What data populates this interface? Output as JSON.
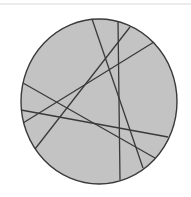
{
  "diagram": {
    "width": 191,
    "height": 197,
    "background": "#ffffff",
    "top_rule": {
      "x1": 0,
      "y1": 4,
      "x2": 191,
      "y2": 4,
      "color": "#d8d8d8"
    },
    "circle": {
      "cx": 99,
      "cy": 101.5,
      "rx": 78,
      "ry": 82.5,
      "fill": "#c3c3c3",
      "stroke": "#3a3a3a",
      "stroke_width": 1.4
    },
    "chords": [
      {
        "id": "chord-1",
        "x1": 92,
        "y1": 19,
        "x2": 143,
        "y2": 168
      },
      {
        "id": "chord-2",
        "x1": 118,
        "y1": 21,
        "x2": 120,
        "y2": 180
      },
      {
        "id": "chord-3",
        "x1": 130,
        "y1": 27,
        "x2": 35,
        "y2": 149
      },
      {
        "id": "chord-4",
        "x1": 154,
        "y1": 42,
        "x2": 23,
        "y2": 123
      },
      {
        "id": "chord-5",
        "x1": 23,
        "y1": 83,
        "x2": 155,
        "y2": 158
      },
      {
        "id": "chord-6",
        "x1": 21,
        "y1": 110,
        "x2": 168,
        "y2": 137
      }
    ],
    "chord_color": "#3a3a3a",
    "chord_width": 1.3
  }
}
